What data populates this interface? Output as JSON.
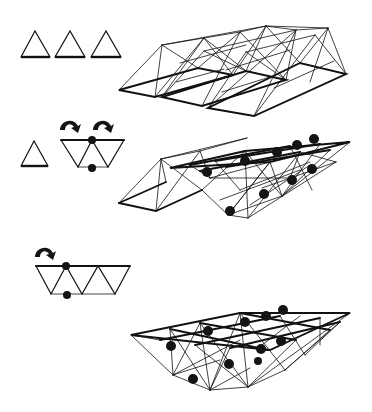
{
  "figure": {
    "colors": {
      "line": "#111111",
      "dot": "#141414",
      "background": "#ffffff"
    }
  },
  "rows": [
    {
      "id": "row-1",
      "left_schematic": {
        "triangles": 3,
        "orientation": "upright",
        "dots": 0,
        "arrows": 0
      },
      "right_structure": {
        "type": "pyramid-truss-strips",
        "strips": 3,
        "dots": 0
      }
    },
    {
      "id": "row-2",
      "left_schematic": {
        "triangles": 1,
        "folded_strip_triangles": 3,
        "orientation": "inverted-zigzag",
        "dots": 2,
        "arrows": 2,
        "arrow_icon": "curled-arrow-icon"
      },
      "right_structure": {
        "type": "double-layer-space-frame-with-pyramid-flange",
        "dots": 10
      }
    },
    {
      "id": "row-3",
      "left_schematic": {
        "folded_strip_triangles": 5,
        "orientation": "inverted-zigzag",
        "dots": 2,
        "arrows": 1,
        "arrow_icon": "curled-arrow-icon"
      },
      "right_structure": {
        "type": "double-layer-space-frame",
        "dots": 10
      }
    }
  ]
}
